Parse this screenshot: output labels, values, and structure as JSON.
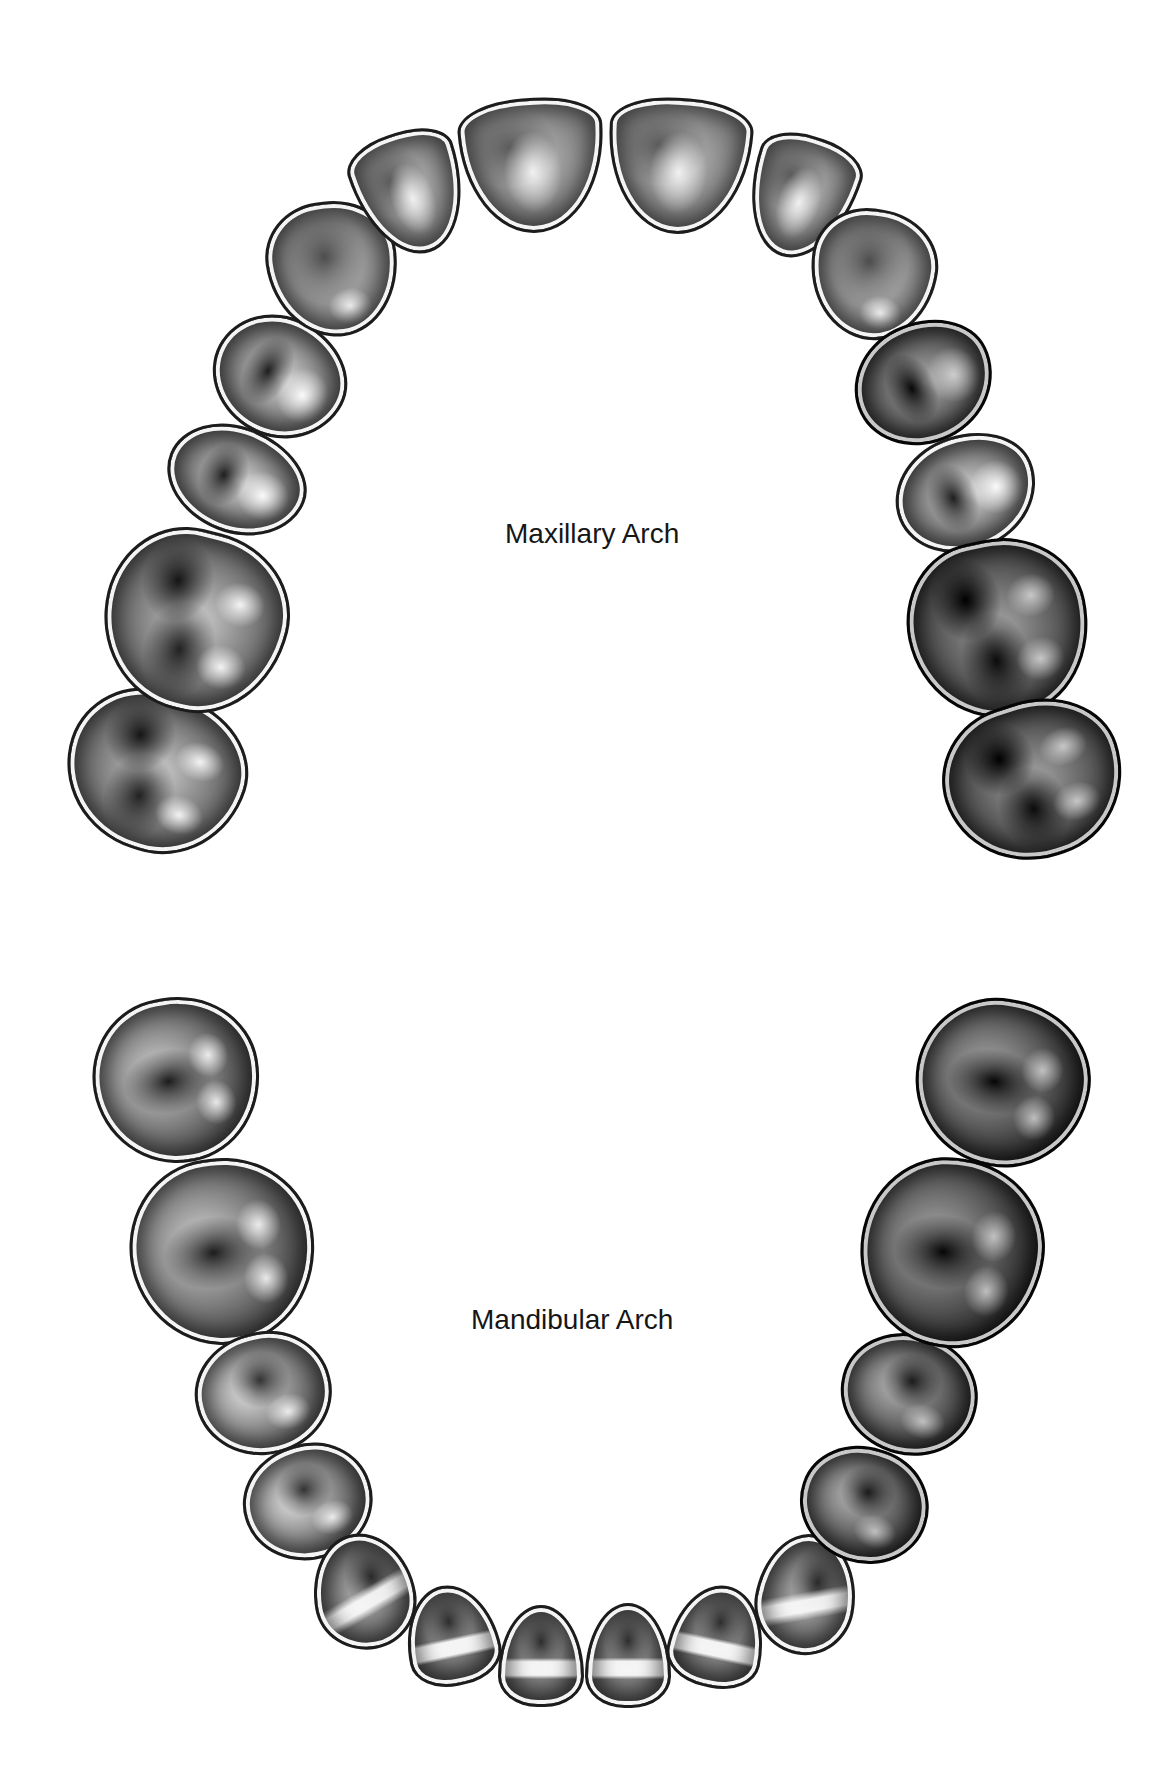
{
  "diagram": {
    "maxillary": {
      "label": "Maxillary Arch",
      "teeth": [
        {
          "name": "right-second-molar",
          "type": "molar"
        },
        {
          "name": "right-first-molar",
          "type": "molar"
        },
        {
          "name": "right-second-premolar",
          "type": "premolar"
        },
        {
          "name": "right-first-premolar",
          "type": "premolar"
        },
        {
          "name": "right-canine",
          "type": "canine"
        },
        {
          "name": "right-lateral-incisor",
          "type": "incisor"
        },
        {
          "name": "right-central-incisor",
          "type": "incisor"
        },
        {
          "name": "left-central-incisor",
          "type": "incisor"
        },
        {
          "name": "left-lateral-incisor",
          "type": "incisor"
        },
        {
          "name": "left-canine",
          "type": "canine"
        },
        {
          "name": "left-first-premolar",
          "type": "premolar"
        },
        {
          "name": "left-second-premolar",
          "type": "premolar"
        },
        {
          "name": "left-first-molar",
          "type": "molar"
        },
        {
          "name": "left-second-molar",
          "type": "molar"
        }
      ]
    },
    "mandibular": {
      "label": "Mandibular Arch",
      "teeth": [
        {
          "name": "right-second-molar",
          "type": "molar"
        },
        {
          "name": "right-first-molar",
          "type": "molar"
        },
        {
          "name": "right-second-premolar",
          "type": "premolar"
        },
        {
          "name": "right-first-premolar",
          "type": "premolar"
        },
        {
          "name": "right-canine",
          "type": "canine"
        },
        {
          "name": "right-lateral-incisor",
          "type": "incisor"
        },
        {
          "name": "right-central-incisor",
          "type": "incisor"
        },
        {
          "name": "left-central-incisor",
          "type": "incisor"
        },
        {
          "name": "left-lateral-incisor",
          "type": "incisor"
        },
        {
          "name": "left-canine",
          "type": "canine"
        },
        {
          "name": "left-first-premolar",
          "type": "premolar"
        },
        {
          "name": "left-second-premolar",
          "type": "premolar"
        },
        {
          "name": "left-first-molar",
          "type": "molar"
        },
        {
          "name": "left-second-molar",
          "type": "molar"
        }
      ]
    }
  }
}
